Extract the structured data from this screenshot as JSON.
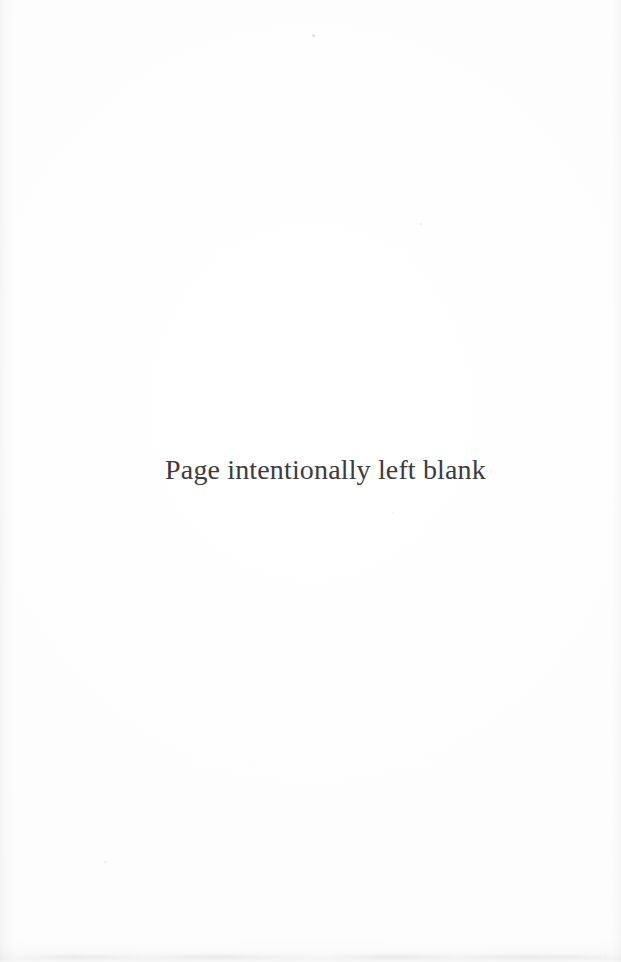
{
  "document": {
    "kind": "scanned-book-page",
    "page_width": 621,
    "page_height": 962,
    "background_color": "#fdfdfd"
  },
  "content": {
    "notice": "Page intentionally left blank"
  },
  "appearance": {
    "text_color": "#3b3b42",
    "paper_color": "#fdfdfd",
    "edge_shade_color": "#96969e"
  },
  "artifacts": {
    "bottom_smudge": "scan-smudge-band",
    "left_edge": "scan-edge-shading-left",
    "right_edge": "scan-edge-shading-right",
    "specks": [
      "speck-top",
      "speck-mid",
      "speck-lower-left",
      "speck-lower-mid"
    ]
  }
}
